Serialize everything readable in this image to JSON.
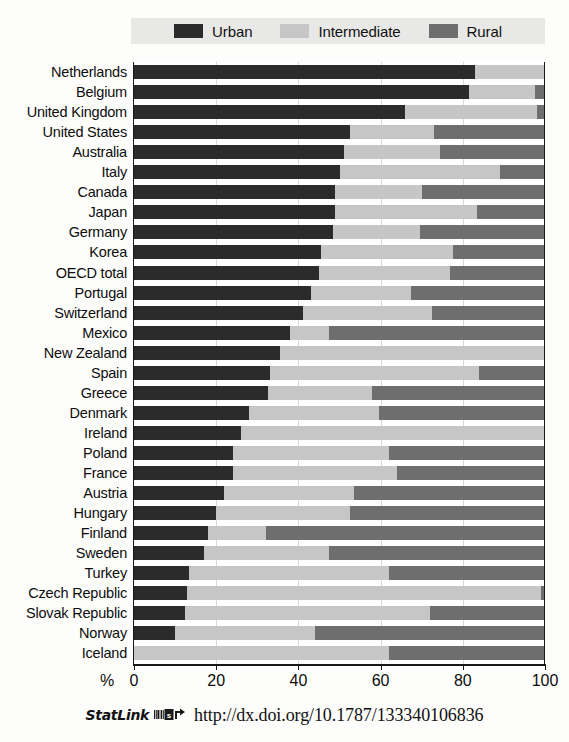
{
  "legend": {
    "entries": [
      {
        "label": "Urban",
        "color": "#2b2b2b",
        "key": "urban"
      },
      {
        "label": "Intermediate",
        "color": "#c6c6c6",
        "key": "intermediate"
      },
      {
        "label": "Rural",
        "color": "#6e6e6e",
        "key": "rural"
      }
    ]
  },
  "axis": {
    "unit_label": "%",
    "ticks": [
      0,
      20,
      40,
      60,
      80,
      100
    ],
    "tick_labels": [
      "0",
      "20",
      "40",
      "60",
      "80",
      "100"
    ],
    "min": 0,
    "max": 100
  },
  "footer": {
    "statlink_word": "StatLink",
    "icon_name": "statlink-barcode-icon",
    "url": "http://dx.doi.org/10.1787/133340106836"
  },
  "chart_data": {
    "type": "bar",
    "orientation": "horizontal",
    "stacked": true,
    "stack_total": 100,
    "title": "",
    "subtitle": "",
    "xlabel": "%",
    "ylabel": "",
    "xlim": [
      0,
      100
    ],
    "grid": true,
    "legend_position": "top",
    "categories": [
      "Netherlands",
      "Belgium",
      "United Kingdom",
      "United States",
      "Australia",
      "Italy",
      "Canada",
      "Japan",
      "Germany",
      "Korea",
      "OECD total",
      "Portugal",
      "Switzerland",
      "Mexico",
      "New Zealand",
      "Spain",
      "Greece",
      "Denmark",
      "Ireland",
      "Poland",
      "France",
      "Austria",
      "Hungary",
      "Finland",
      "Sweden",
      "Turkey",
      "Czech Republic",
      "Slovak Republic",
      "Norway",
      "Iceland"
    ],
    "series": [
      {
        "name": "Urban",
        "color": "#2b2b2b",
        "values": [
          83,
          81.5,
          66,
          52.5,
          51,
          50,
          49,
          49,
          48.5,
          45.5,
          45,
          43,
          41,
          38,
          35.5,
          33,
          32.5,
          28,
          26,
          24,
          24,
          22,
          20,
          18,
          17,
          13.5,
          13,
          12.5,
          10,
          0
        ]
      },
      {
        "name": "Intermediate",
        "color": "#c6c6c6",
        "values": [
          17,
          16,
          32,
          20.5,
          23.5,
          39,
          21,
          34.5,
          21,
          32,
          32,
          24.5,
          31.5,
          9.5,
          64.5,
          51,
          25.5,
          31.5,
          74,
          38,
          40,
          31.5,
          32.5,
          14,
          30.5,
          48.5,
          86,
          59.5,
          34,
          62
        ]
      },
      {
        "name": "Rural",
        "color": "#6e6e6e",
        "values": [
          0,
          2.5,
          2,
          27,
          25.5,
          11,
          30,
          16.5,
          30.5,
          22.5,
          23,
          32.5,
          27.5,
          52.5,
          0,
          16,
          42,
          40.5,
          0,
          38,
          36,
          46.5,
          47.5,
          68,
          52.5,
          38,
          1,
          28,
          56,
          38
        ]
      }
    ]
  }
}
